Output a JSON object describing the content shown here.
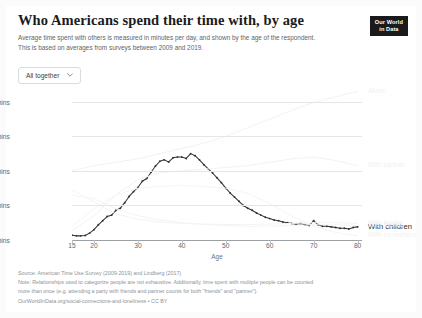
{
  "header": {
    "title": "Who Americans spend their time with, by age",
    "subtitle": "Average time spent with others is measured in minutes per day, and shown by the age of the respondent. This is based on averages from surveys between 2009 and 2019.",
    "logo_line1": "Our World",
    "logo_line2": "in Data"
  },
  "controls": {
    "dropdown_label": "All together",
    "chevron_icon": "chevron-down-icon"
  },
  "footer": {
    "source": "Source: American Time Use Survey (2009-2019) and Lindberg (2017)",
    "note_line1": "Note: Relationships used to categorize people are not exhaustive. Additionally, time spent with multiple people can be counted",
    "note_line2": "more than once (e.g. attending a party with friends and partner counts for both \"friends\" and \"partner\").",
    "url": "OurWorldInData.org/social-connections-and-loneliness",
    "license": "CC BY",
    "separator": "•"
  },
  "chart_data": {
    "type": "line",
    "title": "Who Americans spend their time with, by age",
    "xlabel": "Age",
    "ylabel": "",
    "xlim": [
      15,
      81
    ],
    "ylim": [
      0,
      440
    ],
    "grid": true,
    "legend_position": "right-inline",
    "ytick_labels": [
      "0 mins",
      "100 mins",
      "200 mins",
      "300 mins",
      "400 mins"
    ],
    "ytick_values": [
      0,
      100,
      200,
      300,
      400
    ],
    "xtick_values": [
      15,
      20,
      30,
      40,
      50,
      60,
      70,
      80
    ],
    "xtick_labels": [
      "15",
      "20",
      "30",
      "40",
      "50",
      "60",
      "70",
      "80"
    ],
    "highlighted_series": "With children",
    "series": [
      {
        "name": "With children",
        "label": "With children",
        "color": "#333333",
        "emphasis": "active",
        "x": [
          15,
          16,
          17,
          18,
          19,
          20,
          21,
          22,
          23,
          24,
          25,
          26,
          27,
          28,
          29,
          30,
          31,
          32,
          33,
          34,
          35,
          36,
          37,
          38,
          39,
          40,
          41,
          42,
          43,
          44,
          45,
          46,
          47,
          48,
          49,
          50,
          51,
          52,
          53,
          54,
          55,
          56,
          57,
          58,
          59,
          60,
          61,
          62,
          63,
          64,
          65,
          66,
          67,
          68,
          69,
          70,
          71,
          72,
          73,
          74,
          75,
          76,
          77,
          78,
          79,
          80
        ],
        "values": [
          14,
          12,
          12,
          13,
          20,
          30,
          44,
          56,
          68,
          72,
          86,
          92,
          108,
          126,
          140,
          152,
          170,
          178,
          196,
          214,
          228,
          232,
          226,
          238,
          240,
          240,
          236,
          250,
          244,
          232,
          218,
          206,
          194,
          180,
          166,
          150,
          136,
          124,
          112,
          100,
          92,
          86,
          78,
          72,
          66,
          62,
          58,
          56,
          52,
          50,
          48,
          46,
          48,
          44,
          42,
          56,
          44,
          40,
          40,
          38,
          36,
          34,
          34,
          32,
          36,
          38
        ]
      },
      {
        "name": "Alone",
        "label": "Alone",
        "color": "#f2f3f3",
        "emphasis": "faded",
        "x": [
          15,
          20,
          25,
          30,
          35,
          40,
          45,
          50,
          55,
          60,
          65,
          70,
          75,
          80
        ],
        "values": [
          200,
          215,
          225,
          235,
          250,
          265,
          280,
          300,
          325,
          350,
          375,
          398,
          415,
          430
        ]
      },
      {
        "name": "With partner",
        "label": "With partner",
        "color": "#f2f3f3",
        "emphasis": "faded",
        "x": [
          15,
          20,
          25,
          30,
          35,
          40,
          45,
          50,
          55,
          60,
          65,
          70,
          75,
          80
        ],
        "values": [
          28,
          70,
          130,
          175,
          195,
          200,
          205,
          210,
          215,
          225,
          235,
          240,
          230,
          215
        ]
      },
      {
        "name": "With friends",
        "label": "With friends",
        "color": "#f3f4f4",
        "emphasis": "faded",
        "x": [
          15,
          20,
          25,
          30,
          35,
          40,
          45,
          50,
          55,
          60,
          65,
          70,
          75,
          80
        ],
        "values": [
          130,
          120,
          90,
          70,
          58,
          50,
          45,
          42,
          40,
          40,
          42,
          44,
          44,
          42
        ]
      },
      {
        "name": "With family",
        "label": "With family",
        "color": "#f3f4f4",
        "emphasis": "faded",
        "x": [
          15,
          20,
          25,
          30,
          35,
          40,
          45,
          50,
          55,
          60,
          65,
          70,
          75,
          80
        ],
        "values": [
          145,
          110,
          75,
          60,
          52,
          48,
          46,
          45,
          45,
          46,
          48,
          50,
          50,
          48
        ]
      },
      {
        "name": "With co-workers",
        "label": "With co-workers",
        "color": "#f4f5f5",
        "emphasis": "faded",
        "x": [
          15,
          20,
          25,
          30,
          35,
          40,
          45,
          50,
          55,
          60,
          65,
          70,
          75,
          80
        ],
        "values": [
          40,
          90,
          130,
          150,
          155,
          158,
          155,
          150,
          135,
          105,
          70,
          40,
          22,
          12
        ]
      }
    ]
  }
}
